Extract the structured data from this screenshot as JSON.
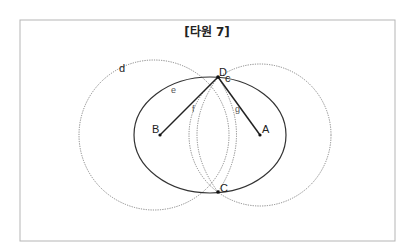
{
  "title": "[타원 7]",
  "colors": {
    "frame": "#b5b5b5",
    "ellipse": "#333333",
    "circles": "#777777",
    "segments": "#222222",
    "points": "#111111"
  },
  "figure": {
    "frame": {
      "x": 20,
      "y": 20,
      "width": 375,
      "height": 221
    },
    "circles": [
      {
        "name": "d",
        "cx": 154,
        "cy": 135,
        "r": 75,
        "style": "dotted"
      },
      {
        "name": "c",
        "cx": 260,
        "cy": 135,
        "r": 71,
        "style": "dotted"
      }
    ],
    "ellipse": {
      "name": "e",
      "cx": 210,
      "cy": 135,
      "rx": 76,
      "ry": 58
    },
    "points": [
      {
        "name": "A",
        "x": 260,
        "y": 135
      },
      {
        "name": "B",
        "x": 160,
        "y": 135
      },
      {
        "name": "C",
        "x": 218,
        "y": 192
      },
      {
        "name": "D",
        "x": 218,
        "y": 77
      }
    ],
    "segments": [
      {
        "name": "f",
        "from": "B",
        "to": "D"
      },
      {
        "name": "g",
        "from": "A",
        "to": "D"
      }
    ]
  },
  "labels": {
    "A": "A",
    "B": "B",
    "C": "C",
    "D": "D",
    "c": "c",
    "d": "d",
    "e": "e",
    "f": "f",
    "g": "g"
  }
}
